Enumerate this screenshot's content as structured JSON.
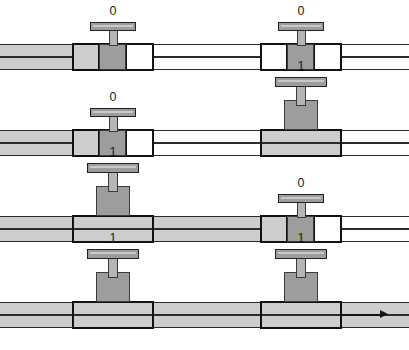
{
  "figure": {
    "colors": {
      "flow_fill": "#cdcdcd",
      "plug_gray": "#9d9d9d",
      "outline": "#111111",
      "pipe_line": "#2b2b2b",
      "background": "#ffffff"
    },
    "state_open": "1",
    "state_closed": "0",
    "geometry": {
      "width": 409,
      "height": 350,
      "row_height": 88,
      "pipe_height": 26,
      "valve_positions": [
        72,
        260
      ]
    }
  },
  "rows": [
    {
      "id": "row-1",
      "top": 14,
      "pipe_top": 30,
      "valves": [
        {
          "id": "valve-1a",
          "state": "0",
          "open": false,
          "left": 72,
          "width": 82,
          "label_top": -2,
          "inlet_fill": true
        },
        {
          "id": "valve-1b",
          "state": "0",
          "open": false,
          "left": 260,
          "width": 82,
          "label_top": -2,
          "inlet_fill": false
        }
      ],
      "flow": {
        "fill_from": 0,
        "fill_to": 100,
        "arrow_x": 78,
        "arrow_len": 22,
        "arrow_shown": true,
        "end_arrow": false
      }
    },
    {
      "id": "row-2",
      "top": 100,
      "pipe_top": 30,
      "valves": [
        {
          "id": "valve-2a",
          "state": "0",
          "open": false,
          "left": 72,
          "width": 82,
          "label_top": -2,
          "inlet_fill": true
        },
        {
          "id": "valve-2b",
          "state": "1",
          "open": true,
          "left": 260,
          "width": 82,
          "label_top": -22,
          "inlet_fill": false
        }
      ],
      "flow": {
        "fill_from": 0,
        "fill_to": 100,
        "arrow_x": 78,
        "arrow_len": 22,
        "arrow_shown": true,
        "end_arrow": false
      }
    },
    {
      "id": "row-3",
      "top": 186,
      "pipe_top": 30,
      "valves": [
        {
          "id": "valve-3a",
          "state": "1",
          "open": true,
          "left": 72,
          "width": 82,
          "label_top": -22,
          "inlet_fill": true
        },
        {
          "id": "valve-3b",
          "state": "0",
          "open": false,
          "left": 260,
          "width": 82,
          "label_top": -2,
          "inlet_fill": true
        }
      ],
      "flow": {
        "fill_from": 0,
        "fill_to": 288,
        "arrow_x": 266,
        "arrow_len": 22,
        "arrow_shown": true,
        "end_arrow": false
      }
    },
    {
      "id": "row-4",
      "top": 272,
      "pipe_top": 30,
      "valves": [
        {
          "id": "valve-4a",
          "state": "1",
          "open": true,
          "left": 72,
          "width": 82,
          "label_top": -22,
          "inlet_fill": true
        },
        {
          "id": "valve-4b",
          "state": "1",
          "open": true,
          "left": 260,
          "width": 82,
          "label_top": -22,
          "inlet_fill": true
        }
      ],
      "flow": {
        "fill_from": 0,
        "fill_to": 409,
        "arrow_x": 340,
        "arrow_len": 48,
        "arrow_shown": true,
        "end_arrow": true
      }
    }
  ]
}
